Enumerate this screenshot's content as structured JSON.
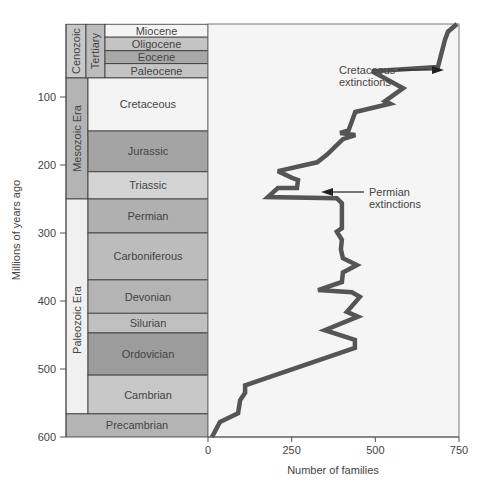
{
  "chart_data": {
    "type": "line",
    "title": "",
    "xlabel": "Number of families",
    "ylabel": "Millions of years ago",
    "xlim": [
      0,
      750
    ],
    "ylim": [
      600,
      0
    ],
    "x_ticks": [
      0,
      250,
      500,
      750
    ],
    "y_ticks": [
      100,
      200,
      300,
      400,
      500,
      600
    ],
    "grid": false,
    "series": [
      {
        "name": "Marine families",
        "points": [
          {
            "mya": -8,
            "families": 744
          },
          {
            "mya": 4,
            "families": 717
          },
          {
            "mya": 16,
            "families": 708
          },
          {
            "mya": 56,
            "families": 687
          },
          {
            "mya": 62,
            "families": 490
          },
          {
            "mya": 87,
            "families": 583
          },
          {
            "mya": 106,
            "families": 529
          },
          {
            "mya": 110,
            "families": 544
          },
          {
            "mya": 122,
            "families": 440
          },
          {
            "mya": 149,
            "families": 420
          },
          {
            "mya": 153,
            "families": 395
          },
          {
            "mya": 156,
            "families": 440
          },
          {
            "mya": 162,
            "families": 403
          },
          {
            "mya": 185,
            "families": 355
          },
          {
            "mya": 196,
            "families": 326
          },
          {
            "mya": 209,
            "families": 209
          },
          {
            "mya": 219,
            "families": 251
          },
          {
            "mya": 222,
            "families": 269
          },
          {
            "mya": 234,
            "families": 266
          },
          {
            "mya": 234,
            "families": 209
          },
          {
            "mya": 247,
            "families": 179
          },
          {
            "mya": 249,
            "families": 385
          },
          {
            "mya": 256,
            "families": 400
          },
          {
            "mya": 293,
            "families": 400
          },
          {
            "mya": 298,
            "families": 385
          },
          {
            "mya": 310,
            "families": 400
          },
          {
            "mya": 324,
            "families": 397
          },
          {
            "mya": 337,
            "families": 403
          },
          {
            "mya": 347,
            "families": 445
          },
          {
            "mya": 358,
            "families": 403
          },
          {
            "mya": 372,
            "families": 400
          },
          {
            "mya": 384,
            "families": 329
          },
          {
            "mya": 387,
            "families": 430
          },
          {
            "mya": 394,
            "families": 454
          },
          {
            "mya": 416,
            "families": 415
          },
          {
            "mya": 423,
            "families": 448
          },
          {
            "mya": 443,
            "families": 349
          },
          {
            "mya": 457,
            "families": 439
          },
          {
            "mya": 469,
            "families": 439
          },
          {
            "mya": 524,
            "families": 111
          },
          {
            "mya": 535,
            "families": 111
          },
          {
            "mya": 546,
            "families": 96
          },
          {
            "mya": 565,
            "families": 90
          },
          {
            "mya": 578,
            "families": 36
          },
          {
            "mya": 600,
            "families": 12
          }
        ]
      }
    ],
    "annotations": [
      {
        "id": "cretaceous",
        "lines": [
          "Cretaceous",
          "extinctions"
        ],
        "mya": 62,
        "families": 490
      },
      {
        "id": "permian",
        "lines": [
          "Permian",
          "extinctions"
        ],
        "mya": 247,
        "families": 320
      }
    ],
    "timescale": {
      "eras": [
        {
          "name": "Cenozoic",
          "from": -7,
          "to": 72,
          "color": "#c8c8c8"
        },
        {
          "name": "Mesozoic Era",
          "from": 72,
          "to": 250,
          "color": "#b4b4b4"
        },
        {
          "name": "Paleozoic Era",
          "from": 250,
          "to": 566,
          "color": "#f0f0f0"
        }
      ],
      "suberas": [
        {
          "name": "Tertiary",
          "from": -7,
          "to": 72,
          "color": "#bcbcbc"
        }
      ],
      "periods": [
        {
          "name": "Miocene",
          "from": -7,
          "to": 12,
          "color": "#f4f4f4"
        },
        {
          "name": "Oligocene",
          "from": 12,
          "to": 32,
          "color": "#c4c4c4"
        },
        {
          "name": "Eocene",
          "from": 32,
          "to": 51,
          "color": "#a8a8a8"
        },
        {
          "name": "Paleocene",
          "from": 51,
          "to": 72,
          "color": "#c4c4c4"
        },
        {
          "name": "Cretaceous",
          "from": 72,
          "to": 150,
          "color": "#f4f4f4"
        },
        {
          "name": "Jurassic",
          "from": 150,
          "to": 210,
          "color": "#a4a4a4"
        },
        {
          "name": "Triassic",
          "from": 210,
          "to": 250,
          "color": "#d4d4d4"
        },
        {
          "name": "Permian",
          "from": 250,
          "to": 300,
          "color": "#b0b0b0"
        },
        {
          "name": "Carboniferous",
          "from": 300,
          "to": 369,
          "color": "#bcbcbc"
        },
        {
          "name": "Devonian",
          "from": 369,
          "to": 418,
          "color": "#b4b4b4"
        },
        {
          "name": "Silurian",
          "from": 418,
          "to": 447,
          "color": "#c0c0c0"
        },
        {
          "name": "Ordovician",
          "from": 447,
          "to": 509,
          "color": "#9c9c9c"
        },
        {
          "name": "Cambrian",
          "from": 509,
          "to": 566,
          "color": "#c8c8c8"
        }
      ],
      "precambrian": {
        "name": "Precambrian",
        "from": 566,
        "to": 600,
        "color": "#b4b4b4"
      }
    },
    "colors": {
      "line": "#555555",
      "plot_bg": "#f5f5f5",
      "axis": "#555555"
    }
  }
}
